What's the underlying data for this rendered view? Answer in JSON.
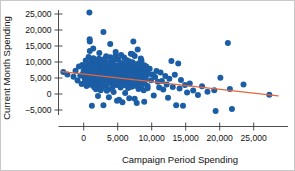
{
  "chart_data": {
    "type": "scatter",
    "title": "",
    "xlabel": "Campaign Period Spending",
    "ylabel": "Current Month Spending",
    "xlim": [
      -4000,
      29000
    ],
    "ylim": [
      -7500,
      27500
    ],
    "xticks": [
      0,
      5000,
      10000,
      15000,
      20000,
      25000
    ],
    "xticklabels": [
      "0",
      "5,000",
      "10,000",
      "15,000",
      "20,000",
      "25,000"
    ],
    "yticks": [
      -5000,
      0,
      5000,
      10000,
      15000,
      20000,
      25000
    ],
    "yticklabels": [
      "−5,000",
      "0",
      "5,000",
      "10,000",
      "15,000",
      "20,000",
      "25,000"
    ],
    "grid": false,
    "legend": null,
    "marker_color": "#1b5ea6",
    "marker_size": 3.0,
    "trendline": {
      "color": "#e2673c",
      "width": 1.4,
      "x0": -3200,
      "y0": 7000,
      "x1": 28600,
      "y1": -600,
      "slope": -0.239,
      "intercept": 6235
    },
    "points": [
      [
        -3000,
        6900
      ],
      [
        -2400,
        6100
      ],
      [
        -1500,
        5400
      ],
      [
        -1200,
        7300
      ],
      [
        -900,
        4200
      ],
      [
        -700,
        8600
      ],
      [
        -500,
        5800
      ],
      [
        -300,
        3100
      ],
      [
        -200,
        9100
      ],
      [
        -100,
        6400
      ],
      [
        0,
        7400
      ],
      [
        60,
        5200
      ],
      [
        120,
        8900
      ],
      [
        180,
        3800
      ],
      [
        240,
        6800
      ],
      [
        300,
        10500
      ],
      [
        340,
        4600
      ],
      [
        380,
        7900
      ],
      [
        420,
        2500
      ],
      [
        470,
        6200
      ],
      [
        520,
        9400
      ],
      [
        560,
        5500
      ],
      [
        600,
        8200
      ],
      [
        640,
        3400
      ],
      [
        690,
        7100
      ],
      [
        720,
        11600
      ],
      [
        760,
        4900
      ],
      [
        800,
        6600
      ],
      [
        840,
        25500
      ],
      [
        880,
        17100
      ],
      [
        900,
        16400
      ],
      [
        940,
        8400
      ],
      [
        980,
        5900
      ],
      [
        1020,
        2900
      ],
      [
        1060,
        7600
      ],
      [
        1100,
        10100
      ],
      [
        1140,
        4300
      ],
      [
        1180,
        6900
      ],
      [
        1220,
        9700
      ],
      [
        1260,
        3600
      ],
      [
        1300,
        8100
      ],
      [
        1340,
        5700
      ],
      [
        1380,
        7300
      ],
      [
        1420,
        11200
      ],
      [
        1460,
        4100
      ],
      [
        1500,
        6500
      ],
      [
        1540,
        2100
      ],
      [
        1580,
        9000
      ],
      [
        1620,
        7700
      ],
      [
        1660,
        5000
      ],
      [
        1700,
        8700
      ],
      [
        1740,
        3300
      ],
      [
        1780,
        6300
      ],
      [
        1820,
        10300
      ],
      [
        1860,
        7000
      ],
      [
        1900,
        4700
      ],
      [
        1940,
        8500
      ],
      [
        1980,
        5600
      ],
      [
        2020,
        2400
      ],
      [
        2060,
        9300
      ],
      [
        2100,
        6700
      ],
      [
        2140,
        7800
      ],
      [
        2180,
        4400
      ],
      [
        2220,
        11000
      ],
      [
        2260,
        6000
      ],
      [
        2300,
        8300
      ],
      [
        2340,
        3000
      ],
      [
        2380,
        7200
      ],
      [
        2420,
        5300
      ],
      [
        2460,
        9800
      ],
      [
        2500,
        6600
      ],
      [
        2540,
        4000
      ],
      [
        2580,
        8000
      ],
      [
        2620,
        1800
      ],
      [
        2660,
        7500
      ],
      [
        2700,
        10700
      ],
      [
        2740,
        5100
      ],
      [
        2780,
        6900
      ],
      [
        2820,
        3700
      ],
      [
        2860,
        8800
      ],
      [
        2900,
        19400
      ],
      [
        2940,
        6200
      ],
      [
        2980,
        4500
      ],
      [
        3020,
        7400
      ],
      [
        3060,
        9600
      ],
      [
        3100,
        5800
      ],
      [
        3140,
        2600
      ],
      [
        3180,
        8200
      ],
      [
        3220,
        6400
      ],
      [
        3260,
        7000
      ],
      [
        3300,
        11800
      ],
      [
        3340,
        4800
      ],
      [
        3380,
        5500
      ],
      [
        3420,
        8600
      ],
      [
        3460,
        3200
      ],
      [
        3500,
        6800
      ],
      [
        3540,
        9200
      ],
      [
        3580,
        7300
      ],
      [
        3620,
        5000
      ],
      [
        3660,
        1500
      ],
      [
        3700,
        8400
      ],
      [
        3740,
        6100
      ],
      [
        3780,
        4200
      ],
      [
        3820,
        10000
      ],
      [
        3860,
        7600
      ],
      [
        3900,
        15600
      ],
      [
        3940,
        5700
      ],
      [
        3980,
        3500
      ],
      [
        4020,
        8900
      ],
      [
        4060,
        6300
      ],
      [
        4100,
        7100
      ],
      [
        4140,
        4600
      ],
      [
        4180,
        9500
      ],
      [
        4220,
        5900
      ],
      [
        4260,
        2200
      ],
      [
        4300,
        8100
      ],
      [
        4340,
        6700
      ],
      [
        4380,
        7800
      ],
      [
        4420,
        4100
      ],
      [
        4460,
        10600
      ],
      [
        4500,
        5400
      ],
      [
        4540,
        3800
      ],
      [
        4580,
        8700
      ],
      [
        4620,
        6500
      ],
      [
        4660,
        7200
      ],
      [
        4700,
        12100
      ],
      [
        4740,
        4900
      ],
      [
        4780,
        5600
      ],
      [
        4820,
        9000
      ],
      [
        4860,
        2800
      ],
      [
        4900,
        7700
      ],
      [
        4940,
        6000
      ],
      [
        4980,
        4300
      ],
      [
        5020,
        8300
      ],
      [
        5060,
        10800
      ],
      [
        5100,
        5200
      ],
      [
        5140,
        3400
      ],
      [
        5180,
        7400
      ],
      [
        5220,
        6600
      ],
      [
        5260,
        9100
      ],
      [
        5300,
        4700
      ],
      [
        5340,
        8000
      ],
      [
        5380,
        5800
      ],
      [
        5420,
        2000
      ],
      [
        5460,
        7000
      ],
      [
        5500,
        6200
      ],
      [
        5540,
        3900
      ],
      [
        5580,
        8500
      ],
      [
        5620,
        5100
      ],
      [
        5660,
        9700
      ],
      [
        5700,
        6900
      ],
      [
        5740,
        4400
      ],
      [
        5780,
        7500
      ],
      [
        5820,
        3100
      ],
      [
        5860,
        8200
      ],
      [
        5900,
        5500
      ],
      [
        5940,
        11400
      ],
      [
        5980,
        6400
      ],
      [
        6020,
        4000
      ],
      [
        6060,
        7900
      ],
      [
        6100,
        2700
      ],
      [
        6140,
        6100
      ],
      [
        6180,
        8800
      ],
      [
        6220,
        5300
      ],
      [
        6260,
        9400
      ],
      [
        6300,
        7100
      ],
      [
        6340,
        3600
      ],
      [
        6380,
        6600
      ],
      [
        6420,
        4800
      ],
      [
        6460,
        8100
      ],
      [
        6500,
        5700
      ],
      [
        6540,
        1900
      ],
      [
        6580,
        7300
      ],
      [
        6620,
        6000
      ],
      [
        6660,
        10200
      ],
      [
        6700,
        4500
      ],
      [
        6740,
        8600
      ],
      [
        6780,
        5900
      ],
      [
        6820,
        3300
      ],
      [
        6860,
        7600
      ],
      [
        6900,
        6300
      ],
      [
        6940,
        12600
      ],
      [
        6980,
        4900
      ],
      [
        7020,
        8400
      ],
      [
        7060,
        2300
      ],
      [
        7100,
        6700
      ],
      [
        7140,
        5200
      ],
      [
        7180,
        9900
      ],
      [
        7220,
        7000
      ],
      [
        7260,
        3700
      ],
      [
        7300,
        16400
      ],
      [
        7340,
        6500
      ],
      [
        7380,
        4200
      ],
      [
        7420,
        8000
      ],
      [
        7460,
        5600
      ],
      [
        7500,
        11900
      ],
      [
        7540,
        7200
      ],
      [
        7580,
        2600
      ],
      [
        7620,
        6100
      ],
      [
        7660,
        9300
      ],
      [
        7700,
        4600
      ],
      [
        7740,
        7800
      ],
      [
        7780,
        5000
      ],
      [
        7820,
        3000
      ],
      [
        7860,
        8500
      ],
      [
        7900,
        6400
      ],
      [
        7940,
        13900
      ],
      [
        7980,
        4100
      ],
      [
        8020,
        7400
      ],
      [
        8060,
        1600
      ],
      [
        8100,
        5800
      ],
      [
        8140,
        9600
      ],
      [
        8180,
        6900
      ],
      [
        8220,
        3500
      ],
      [
        8260,
        7100
      ],
      [
        8300,
        4800
      ],
      [
        8340,
        8300
      ],
      [
        8380,
        5400
      ],
      [
        8420,
        2100
      ],
      [
        8460,
        6600
      ],
      [
        8500,
        10400
      ],
      [
        8540,
        7500
      ],
      [
        8580,
        3900
      ],
      [
        8620,
        5100
      ],
      [
        8660,
        8900
      ],
      [
        8700,
        6200
      ],
      [
        8740,
        4400
      ],
      [
        8780,
        7700
      ],
      [
        8820,
        1200
      ],
      [
        8860,
        5600
      ],
      [
        8900,
        9000
      ],
      [
        8940,
        6800
      ],
      [
        8980,
        3200
      ],
      [
        9020,
        7300
      ],
      [
        9100,
        4700
      ],
      [
        9200,
        8600
      ],
      [
        9300,
        5900
      ],
      [
        9400,
        2500
      ],
      [
        9500,
        6400
      ],
      [
        9700,
        7900
      ],
      [
        9900,
        4300
      ],
      [
        10100,
        6100
      ],
      [
        10300,
        -500
      ],
      [
        10500,
        5300
      ],
      [
        10700,
        7200
      ],
      [
        10900,
        3800
      ],
      [
        11100,
        2000
      ],
      [
        11300,
        6700
      ],
      [
        11500,
        4100
      ],
      [
        11700,
        1400
      ],
      [
        12000,
        5600
      ],
      [
        12200,
        3000
      ],
      [
        12400,
        -1200
      ],
      [
        12600,
        4800
      ],
      [
        12900,
        10300
      ],
      [
        13100,
        2200
      ],
      [
        13400,
        6000
      ],
      [
        13600,
        -3500
      ],
      [
        13900,
        9500
      ],
      [
        14100,
        1700
      ],
      [
        14300,
        4400
      ],
      [
        14600,
        -3700
      ],
      [
        14900,
        2800
      ],
      [
        15200,
        500
      ],
      [
        15600,
        3300
      ],
      [
        16100,
        1100
      ],
      [
        16800,
        -300
      ],
      [
        17400,
        2400
      ],
      [
        18200,
        700
      ],
      [
        19200,
        1200
      ],
      [
        19400,
        -5300
      ],
      [
        20100,
        5100
      ],
      [
        21200,
        15900
      ],
      [
        21500,
        1600
      ],
      [
        21800,
        -4700
      ],
      [
        23500,
        3000
      ],
      [
        27300,
        -200
      ],
      [
        1200,
        -3700
      ],
      [
        2900,
        -3500
      ],
      [
        5200,
        -1800
      ],
      [
        3400,
        1000
      ],
      [
        2100,
        -600
      ],
      [
        4400,
        600
      ],
      [
        6700,
        -1300
      ],
      [
        7500,
        -1500
      ],
      [
        8900,
        -2400
      ],
      [
        4900,
        -2100
      ],
      [
        6100,
        300
      ],
      [
        3700,
        -1000
      ],
      [
        2500,
        1200
      ],
      [
        7800,
        -2800
      ],
      [
        9400,
        1800
      ],
      [
        5700,
        -2600
      ],
      [
        1800,
        1500
      ],
      [
        900,
        13400
      ],
      [
        1400,
        14200
      ],
      [
        2300,
        12800
      ],
      [
        3100,
        10900
      ],
      [
        5500,
        12200
      ],
      [
        7200,
        12400
      ],
      [
        8400,
        11100
      ],
      [
        6300,
        10600
      ],
      [
        4700,
        13100
      ],
      [
        3900,
        11500
      ]
    ]
  }
}
